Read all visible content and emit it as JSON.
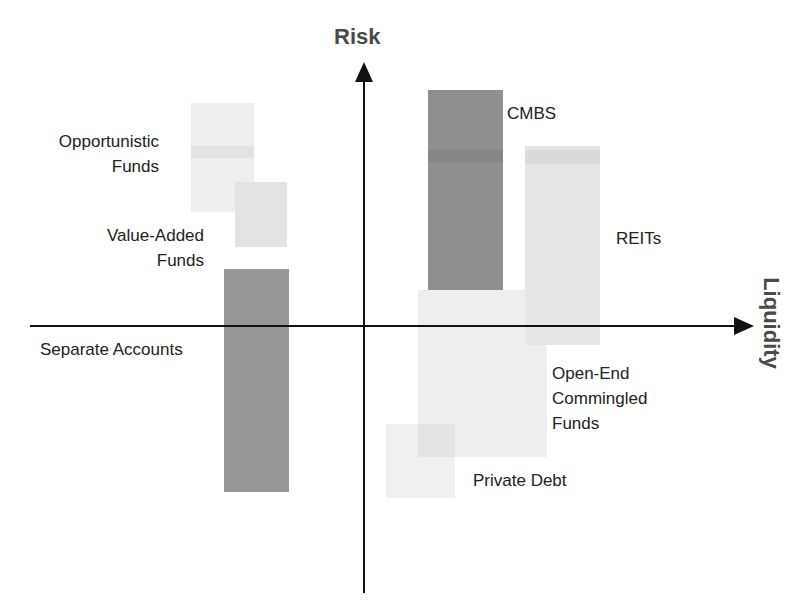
{
  "axes": {
    "y_label": "Risk",
    "x_label": "Liquidity"
  },
  "categories": [
    {
      "name": "Opportunistic Funds",
      "line1": "Opportunistic",
      "line2": "Funds",
      "shade": "very light"
    },
    {
      "name": "Value-Added Funds",
      "line1": "Value-Added",
      "line2": "Funds",
      "shade": "light"
    },
    {
      "name": "Separate Accounts",
      "line1": "Separate Accounts",
      "shade": "dark"
    },
    {
      "name": "CMBS",
      "line1": "CMBS",
      "shade": "dark"
    },
    {
      "name": "REITs",
      "line1": "REITs",
      "shade": "light"
    },
    {
      "name": "Open-End Commingled Funds",
      "line1": "Open-End",
      "line2": "Commingled",
      "line3": "Funds",
      "shade": "very light"
    },
    {
      "name": "Private Debt",
      "line1": "Private Debt",
      "shade": "very light"
    }
  ],
  "colors": {
    "axis": "#111111",
    "dark_box": "#979797",
    "light_box": "#e2e2e2",
    "very_light_box": "#ececec",
    "axis_title": "#4a4a4a"
  }
}
